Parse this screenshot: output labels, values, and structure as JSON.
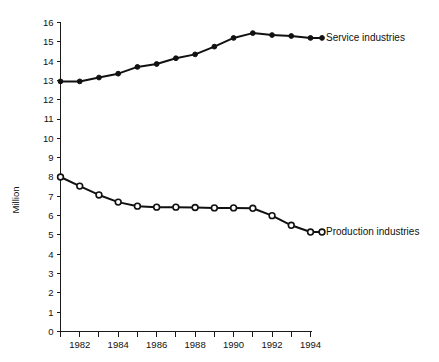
{
  "chart_data": {
    "type": "line",
    "title": "",
    "subtitle": "",
    "xlabel": "",
    "ylabel": "Million",
    "xlim": [
      1981,
      1994
    ],
    "ylim": [
      0,
      16
    ],
    "grid": false,
    "legend_position": "right-inline",
    "x": [
      1981,
      1982,
      1983,
      1984,
      1985,
      1986,
      1987,
      1988,
      1989,
      1990,
      1991,
      1992,
      1993,
      1994
    ],
    "xtick_labels": [
      "1982",
      "1984",
      "1986",
      "1988",
      "1990",
      "1992",
      "1994"
    ],
    "xtick_values": [
      1982,
      1984,
      1986,
      1988,
      1990,
      1992,
      1994
    ],
    "ytick_labels": [
      "0",
      "1",
      "2",
      "3",
      "4",
      "5",
      "6",
      "7",
      "8",
      "9",
      "10",
      "11",
      "12",
      "13",
      "14",
      "15",
      "16"
    ],
    "ytick_values": [
      0,
      1,
      2,
      3,
      4,
      5,
      6,
      7,
      8,
      9,
      10,
      11,
      12,
      13,
      14,
      15,
      16
    ],
    "series": [
      {
        "name": "Service industries",
        "marker": "filled-circle",
        "color": "#111111",
        "label_text": "Service industries",
        "values": [
          12.95,
          12.95,
          13.15,
          13.35,
          13.7,
          13.85,
          14.15,
          14.35,
          14.75,
          15.2,
          15.45,
          15.35,
          15.3,
          15.2
        ]
      },
      {
        "name": "Production industries",
        "marker": "open-circle",
        "color": "#111111",
        "label_text": "Production industries",
        "values": [
          8.0,
          7.53,
          7.07,
          6.7,
          6.49,
          6.44,
          6.44,
          6.42,
          6.4,
          6.4,
          6.38,
          6.0,
          5.5,
          5.15
        ]
      }
    ]
  },
  "axis": {
    "y_title": "Million"
  }
}
